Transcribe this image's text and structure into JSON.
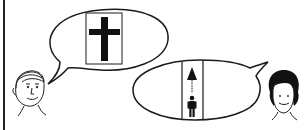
{
  "illustration": {
    "description": "Two people exchanging speech bubbles",
    "left_person": {
      "icon": "man-face-icon",
      "bubble_symbol": "cross-icon"
    },
    "right_person": {
      "icon": "woman-face-icon",
      "bubble_symbol": "person-upward-arrow-icon"
    },
    "colors": {
      "line": "#1a1a1a",
      "background": "#ffffff",
      "fill": "#111111"
    }
  }
}
